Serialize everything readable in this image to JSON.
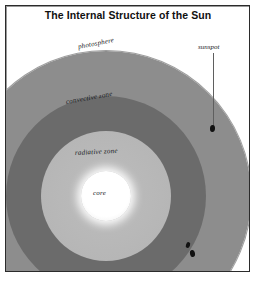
{
  "figure": {
    "title": "The Internal Structure of the Sun",
    "frame": {
      "visible": true,
      "border_color": "#2b2b2b"
    },
    "background_color": "#ffffff"
  },
  "diagram": {
    "type": "cross-section",
    "subject": "Sun",
    "layers": [
      {
        "name": "photosphere",
        "label": "photosphere",
        "color": "#8d8d8d",
        "order": 1,
        "position": "outermost"
      },
      {
        "name": "convective-zone",
        "label": "convective zone",
        "color": "#6b6b6b",
        "order": 2
      },
      {
        "name": "radiative-zone",
        "label": "radiative zone",
        "color": "#b6b6b6",
        "order": 3
      },
      {
        "name": "core",
        "label": "core",
        "color": "#ffffff",
        "order": 4,
        "position": "innermost"
      }
    ],
    "features": [
      {
        "name": "sunspot",
        "label": "sunspot",
        "color": "#121212",
        "count": 3,
        "has_leader_line": true
      }
    ]
  },
  "labels": {
    "photosphere": "photosphere",
    "convective_zone": "convective zone",
    "radiative_zone": "radiative zone",
    "core": "core",
    "sunspot": "sunspot"
  }
}
